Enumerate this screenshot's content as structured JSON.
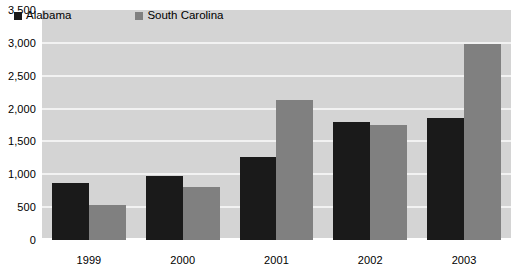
{
  "chart_data": {
    "type": "bar",
    "title": "",
    "subtitle": "",
    "xlabel": "",
    "ylabel": "",
    "categories": [
      "1999",
      "2000",
      "2001",
      "2002",
      "2003"
    ],
    "series": [
      {
        "name": "Alabama",
        "color": "#1a1a1a",
        "values": [
          870,
          970,
          1270,
          1790,
          1850
        ]
      },
      {
        "name": "South Carolina",
        "color": "#808080",
        "values": [
          530,
          800,
          2130,
          1750,
          2980
        ]
      }
    ],
    "ylim": [
      0,
      3500
    ],
    "ytick_step": 500,
    "ytick_labels": [
      "3,500",
      "3,000",
      "2,500",
      "2,000",
      "1,500",
      "1,000",
      "500",
      "0"
    ],
    "ytick_values": [
      3500,
      3000,
      2500,
      2000,
      1500,
      1000,
      500,
      0
    ],
    "grid": true,
    "grid_color": "#f2f2f2",
    "legend_position": "top-left",
    "plot_background": "#d4d4d4",
    "page_background": "#ffffff",
    "axis_text_color": "#000000"
  },
  "legend": {
    "entries": [
      {
        "label": "Alabama",
        "swatch": "legend-swatch-alabama"
      },
      {
        "label": "South Carolina",
        "swatch": "legend-swatch-south-carolina"
      }
    ]
  }
}
